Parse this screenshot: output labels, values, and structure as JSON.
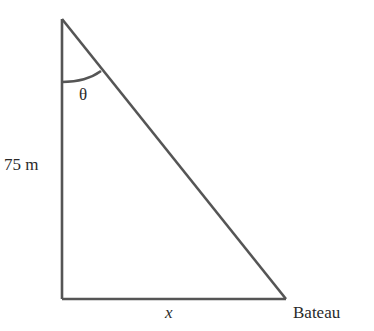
{
  "diagram": {
    "type": "right-triangle",
    "labels": {
      "angle": "θ",
      "vertical_side": "75 m",
      "horizontal_side": "x",
      "bottom_right_vertex": "Bateau"
    },
    "colors": {
      "stroke": "#555555",
      "text": "#2a2a2a",
      "background": "#ffffff"
    }
  }
}
